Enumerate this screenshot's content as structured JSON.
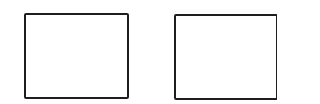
{
  "diagram": {
    "background": "#ffffff",
    "stroke_color": "#1e1e1e",
    "boxes": [
      {
        "id": "left",
        "label": ""
      },
      {
        "id": "right",
        "label": ""
      }
    ]
  }
}
